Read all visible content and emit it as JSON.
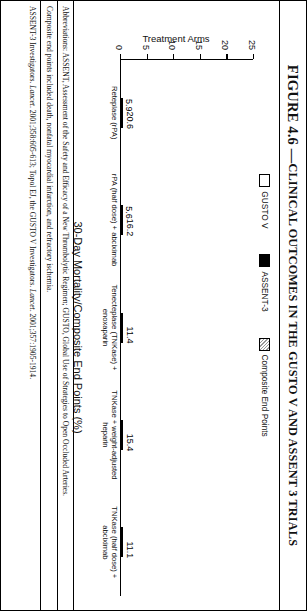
{
  "figure": {
    "title_prefix": "FIGURE 4.6 — ",
    "title_main": "CLINICAL OUTCOMES IN THE GUSTO V AND ASSENT 3 TRIALS"
  },
  "legend": {
    "items": [
      {
        "label": "GUSTO V",
        "swatch": "white-square-icon",
        "color": "#ffffff"
      },
      {
        "label": "ASSENT-3",
        "swatch": "black-square-icon",
        "color": "#000000"
      },
      {
        "label": "Composite End Points",
        "swatch": "hatched-square-icon",
        "color": "#8f8f8f"
      }
    ]
  },
  "axes": {
    "x_title": "Treatment Arms",
    "y_title": "30-Day Mortality/Composite End Points (%)",
    "y_ticks": [
      "0",
      "5",
      "10",
      "15",
      "20",
      "25"
    ]
  },
  "chart_data": {
    "type": "bar",
    "title": "FIGURE 4.6 — CLINICAL OUTCOMES IN THE GUSTO V AND ASSENT 3 TRIALS",
    "xlabel": "Treatment Arms",
    "ylabel": "30-Day Mortality/Composite End Points (%)",
    "ylim": [
      0,
      25
    ],
    "yticks": [
      0,
      5,
      10,
      15,
      20,
      25
    ],
    "grid": false,
    "legend_position": "top-center",
    "categories": [
      "Reteplase (rPA)",
      "rPA (half dose) + abciximab",
      "Tenecteplase (TNKase) + enoxaparin",
      "TNKase + weight-adjusted heparin",
      "TNKase (half dose) + abciximab"
    ],
    "series": [
      {
        "name": "30-Day Mortality",
        "trial": [
          "GUSTO V",
          "GUSTO V",
          "ASSENT-3",
          "ASSENT-3",
          "ASSENT-3"
        ],
        "fill": [
          "white",
          "white",
          "black",
          "black",
          "black"
        ],
        "values": [
          5.9,
          5.6,
          5.4,
          6.0,
          6.6
        ],
        "labels": [
          "5.9",
          "5.6",
          "5.4",
          "6.0",
          "6.6"
        ]
      },
      {
        "name": "Composite End Points",
        "fill": [
          "hatch",
          "hatch",
          "hatch",
          "hatch",
          "hatch"
        ],
        "values": [
          20.6,
          16.2,
          11.4,
          15.4,
          11.1
        ],
        "labels": [
          "20.6",
          "16.2",
          "11.4",
          "15.4",
          "11.1"
        ]
      }
    ]
  },
  "notes": {
    "abbreviations": "Abbreviations: ASSENT, Assessment of the Safety and Efficacy of a New Thrombolytic Regimen; GUSTO, Global Use of Strategies to Open Occluded Arteries.",
    "composite": "Composite end points included death, nonfatal myocardial infarction, and refractory ischemia.",
    "citation_a": "ASSENT-3 Investigators. ",
    "citation_a_italic": "Lancet",
    "citation_a_rest": ". 2001;358:605-613; Topol EJ, the GUSTO V Investigators. ",
    "citation_b_italic": "Lancet",
    "citation_b_rest": ". 2001;357:1905-1914."
  }
}
